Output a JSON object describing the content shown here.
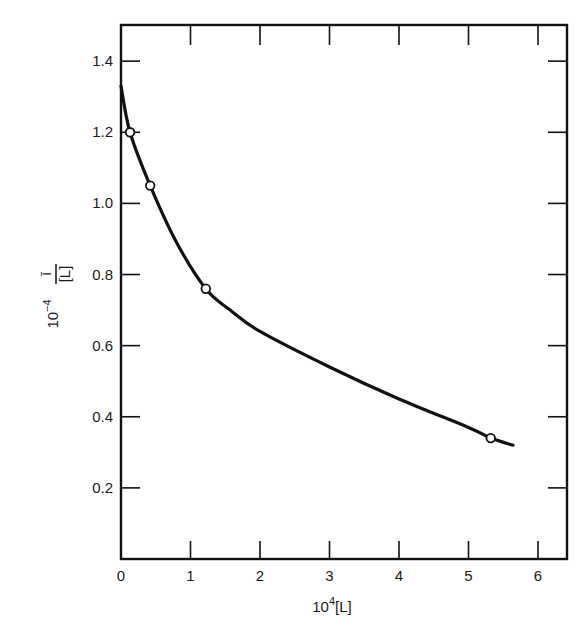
{
  "chart_data": {
    "type": "line",
    "title": "",
    "xlabel": "10^4[L]",
    "xlabel_parts": {
      "base": "10",
      "sup": "4",
      "rest": "[L]"
    },
    "ylabel": "10^-4 ī/[L]",
    "ylabel_parts": {
      "base": "10",
      "sup": "−4",
      "num": "ī",
      "den": "[L]"
    },
    "xlim": [
      0,
      6.5
    ],
    "ylim": [
      0,
      1.5
    ],
    "x_ticks": [
      0,
      1,
      2,
      3,
      4,
      5,
      6
    ],
    "x_tick_labels": [
      "0",
      "1",
      "2",
      "3",
      "4",
      "5",
      "6"
    ],
    "y_ticks": [
      0.2,
      0.4,
      0.6,
      0.8,
      1.0,
      1.2,
      1.4
    ],
    "y_tick_labels": [
      "0.2",
      "0.4",
      "0.6",
      "0.8",
      "1.0",
      "1.2",
      "1.4"
    ],
    "grid": false,
    "legend": null,
    "series": [
      {
        "name": "data points",
        "kind": "scatter",
        "marker": "open-circle",
        "x": [
          0.13,
          0.42,
          1.22,
          5.32
        ],
        "y": [
          1.2,
          1.05,
          0.76,
          0.34
        ]
      },
      {
        "name": "fitted curve",
        "kind": "line",
        "x": [
          0.0,
          0.13,
          0.42,
          0.8,
          1.22,
          1.57,
          2.0,
          3.0,
          4.0,
          5.0,
          5.32,
          5.64
        ],
        "y": [
          1.33,
          1.2,
          1.05,
          0.89,
          0.76,
          0.7,
          0.64,
          0.54,
          0.45,
          0.37,
          0.34,
          0.32
        ]
      }
    ],
    "colors": {
      "line": "#111111",
      "axis": "#111111",
      "marker_fill": "#ffffff",
      "background": "#ffffff"
    }
  }
}
